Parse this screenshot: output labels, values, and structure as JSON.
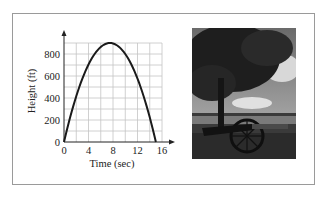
{
  "figure": {
    "photo_alt": "Cannon under a tree in a field"
  },
  "chart_data": {
    "type": "line",
    "title": "",
    "xlabel": "Time (sec)",
    "ylabel": "Height (ft)",
    "xlim": [
      0,
      16
    ],
    "ylim": [
      0,
      900
    ],
    "x_ticks": [
      "0",
      "4",
      "8",
      "12",
      "16"
    ],
    "y_ticks": [
      "0",
      "200",
      "400",
      "600",
      "800"
    ],
    "grid": true,
    "series": [
      {
        "name": "h(t) = 240t - 16t^2",
        "x": [
          0,
          1,
          2,
          3,
          4,
          5,
          6,
          7,
          7.5,
          8,
          9,
          10,
          11,
          12,
          13,
          14,
          15
        ],
        "y": [
          0,
          224,
          416,
          576,
          704,
          800,
          864,
          896,
          900,
          896,
          864,
          800,
          704,
          576,
          416,
          224,
          0
        ]
      }
    ]
  }
}
